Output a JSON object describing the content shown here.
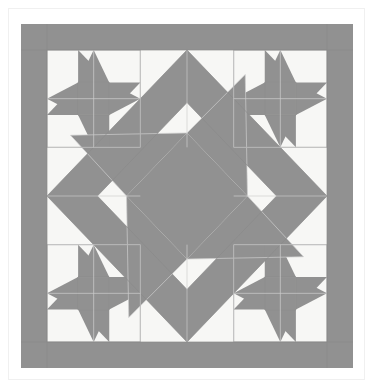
{
  "document": {
    "title": "Quilt Block Diagram",
    "page_background": "#ffffff",
    "frame_border_color": "#f0f0f0"
  },
  "quilt": {
    "name": "star-medallion-quilt-block",
    "description": "Square quilt block: gray outer border, four corner pinwheel star blocks, a large square-on-point gray frame, and a central pinwheel medallion",
    "colors": {
      "fabric_dark": "#919191",
      "fabric_light": "#f7f7f5",
      "seam_line": "#cfcfcf",
      "seam_line_strong": "#8a8a8a"
    },
    "geometry": {
      "block_x": 21,
      "block_y": 24,
      "block_width": 332,
      "block_height": 344,
      "border_width": 26,
      "grid_columns": 6,
      "grid_rows": 6,
      "cell_width": 46.6,
      "cell_height": 48.6
    },
    "regions": [
      {
        "name": "outer-border",
        "fill": "fabric_dark"
      },
      {
        "name": "corner-star-top-left",
        "fill": "mixed"
      },
      {
        "name": "corner-star-top-right",
        "fill": "mixed"
      },
      {
        "name": "corner-star-bottom-left",
        "fill": "mixed"
      },
      {
        "name": "corner-star-bottom-right",
        "fill": "mixed"
      },
      {
        "name": "on-point-diamond-frame",
        "fill": "fabric_dark"
      },
      {
        "name": "center-pinwheel",
        "fill": "mixed"
      }
    ]
  }
}
